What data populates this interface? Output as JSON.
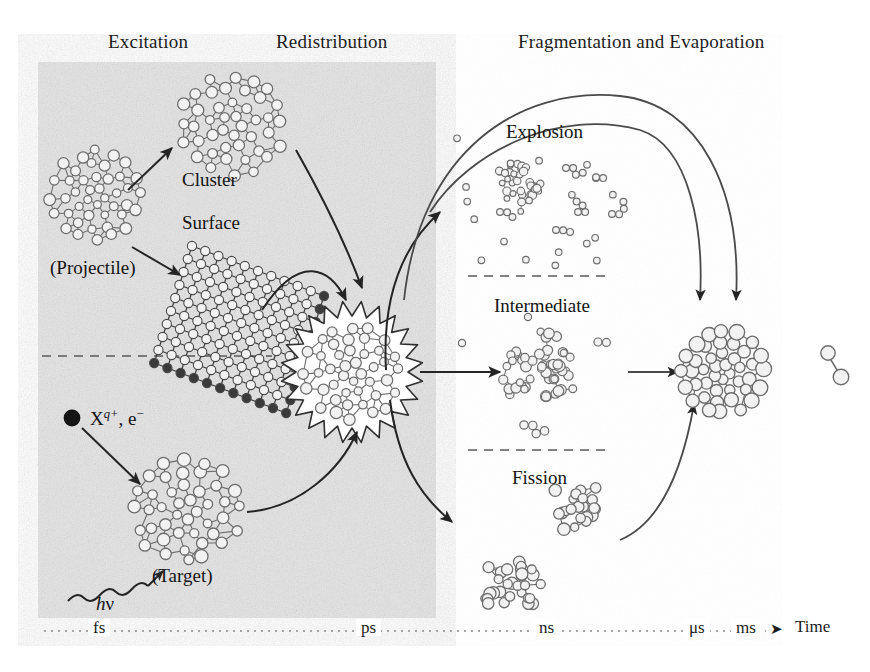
{
  "figure": {
    "type": "process-diagram"
  },
  "phases": [
    {
      "id": "excitation",
      "label": "Excitation",
      "x": 108,
      "y": 32
    },
    {
      "id": "redistribution",
      "label": "Redistribution",
      "x": 276,
      "y": 32
    },
    {
      "id": "fragmentation",
      "label": "Fragmentation and Evaporation",
      "x": 518,
      "y": 32
    }
  ],
  "excitation": {
    "upper": {
      "cluster_label": "Cluster",
      "surface_label": "Surface",
      "projectile_label": "(Projectile)"
    },
    "lower": {
      "ion_label_x": "X",
      "ion_label_q": "q+",
      "ion_label_e": ", e",
      "ion_label_e_sup": "−",
      "photon_label_h": "h",
      "photon_label_nu": "ν",
      "target_label": "(Target)"
    }
  },
  "branches": [
    {
      "id": "explosion",
      "label": "Explosion",
      "x": 506,
      "y": 122
    },
    {
      "id": "intermediate",
      "label": "Intermediate",
      "x": 494,
      "y": 296
    },
    {
      "id": "fission",
      "label": "Fission",
      "x": 512,
      "y": 468
    }
  ],
  "timeline": {
    "arrow_glyph": "➤",
    "axis_label": "Time",
    "ticks": [
      {
        "label": "fs",
        "x": 88
      },
      {
        "label": "ps",
        "x": 356
      },
      {
        "label": "ns",
        "x": 534
      },
      {
        "label": "μs",
        "x": 684
      },
      {
        "label": "ms",
        "x": 731
      }
    ],
    "arrow_x": 770,
    "time_x": 795,
    "y": 625
  },
  "colors": {
    "ink": "#1a1a1a",
    "line": "#3a3a3a",
    "paper": "#ffffff",
    "panel_gray": "#e3e3e3",
    "atom_fill": "#f2f2f2",
    "atom_stroke": "#6d6d6d",
    "dash": "#555555",
    "surface_dark": "#2a2a2a"
  },
  "panel": {
    "x": 38,
    "y": 62,
    "w": 398,
    "h": 556
  }
}
